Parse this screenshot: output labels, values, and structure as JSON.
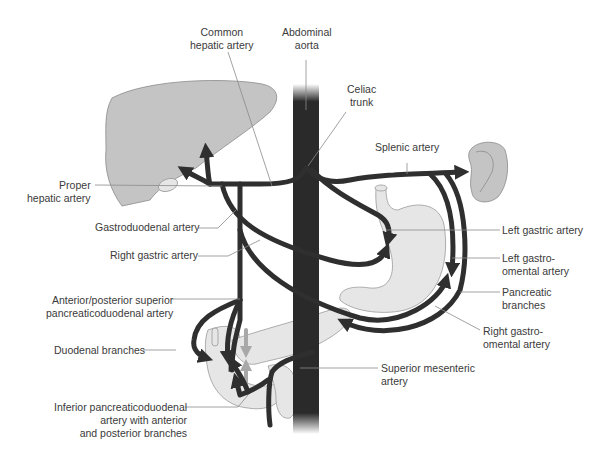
{
  "diagram": {
    "type": "anatomical",
    "colors": {
      "artery": "#2f2f2f",
      "aorta": "#2a2a2a",
      "liver": "#c4c4c4",
      "spleen": "#c4c4c4",
      "stomach": "#e6e6e6",
      "pancreas": "#e6e6e6",
      "leader_line": "#8a8a8a",
      "label_text": "#3a3a3a"
    },
    "labels": {
      "common_hepatic_artery": "Common\nhepatic artery",
      "abdominal_aorta": "Abdominal\naorta",
      "celiac_trunk": "Celiac\ntrunk",
      "splenic_artery": "Splenic artery",
      "proper_hepatic_artery": "Proper\nhepatic artery",
      "gastroduodenal_artery": "Gastroduodenal artery",
      "right_gastric_artery": "Right gastric artery",
      "ant_post_sup_pd_artery": "Anterior/posterior superior\npancreaticoduodenal artery",
      "duodenal_branches": "Duodenal branches",
      "inferior_pd_artery": "Inferior pancreaticoduodenal\nartery with anterior\nand posterior branches",
      "left_gastric_artery": "Left gastric artery",
      "left_gastro_omental_artery": "Left gastro-\nomental artery",
      "pancreatic_branches": "Pancreatic\nbranches",
      "right_gastro_omental_artery": "Right gastro-\nomental artery",
      "superior_mesenteric_artery": "Superior mesenteric\nartery"
    },
    "structures": [
      "liver",
      "gallbladder",
      "spleen",
      "stomach",
      "duodenum",
      "pancreas",
      "abdominal aorta"
    ]
  }
}
